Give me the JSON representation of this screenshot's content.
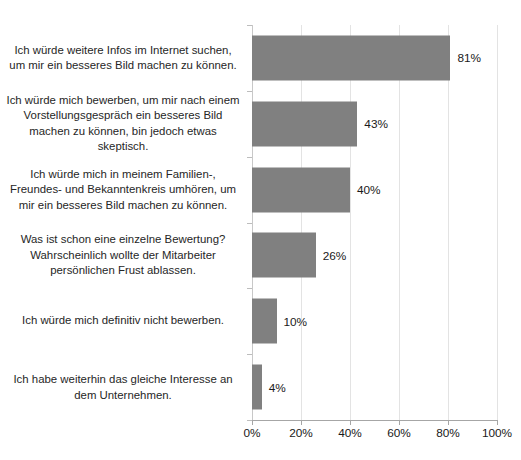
{
  "chart_data": {
    "type": "bar",
    "orientation": "horizontal",
    "title": "",
    "subtitle": "",
    "xlabel": "",
    "ylabel": "",
    "xlim": [
      0,
      100
    ],
    "grid": true,
    "legend": null,
    "legend_position": "none",
    "bar_color": "#808080",
    "categories": [
      "Ich würde weitere Infos im Internet suchen, um mir ein besseres Bild machen zu können.",
      "Ich würde mich bewerben, um mir nach einem Vorstellungsgespräch ein besseres Bild machen zu können, bin jedoch etwas skeptisch.",
      "Ich würde mich in meinem Familien-, Freundes- und Bekanntenkreis umhören, um mir ein besseres Bild machen zu können.",
      "Was ist schon eine einzelne Bewertung? Wahrscheinlich wollte der Mitarbeiter persönlichen Frust ablassen.",
      "Ich würde mich definitiv nicht bewerben.",
      "Ich habe weiterhin das gleiche Interesse an dem Unternehmen."
    ],
    "values": [
      81,
      43,
      40,
      26,
      10,
      4
    ],
    "data_labels": [
      "81%",
      "43%",
      "40%",
      "26%",
      "10%",
      "4%"
    ],
    "xticks": [
      0,
      20,
      40,
      60,
      80,
      100
    ],
    "xtick_labels": [
      "0%",
      "20%",
      "40%",
      "60%",
      "80%",
      "100%"
    ]
  }
}
